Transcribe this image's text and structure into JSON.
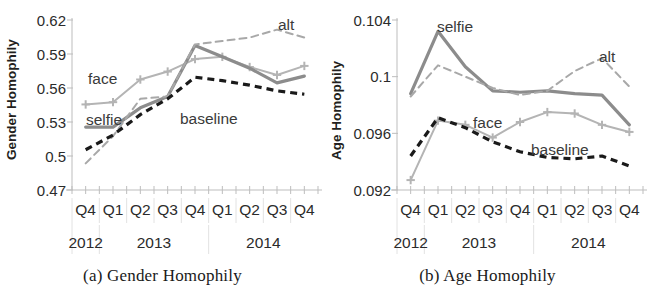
{
  "figure": {
    "panels": [
      {
        "id": "gender",
        "caption": "(a) Gender Homophily"
      },
      {
        "id": "age",
        "caption": "(b) Age Homophily"
      }
    ]
  },
  "chart_data": [
    {
      "type": "line",
      "title": "(a) Gender Homophily",
      "xlabel": "",
      "ylabel": "Gender Homophily",
      "categories": [
        "Q4",
        "Q1",
        "Q2",
        "Q3",
        "Q4",
        "Q1",
        "Q2",
        "Q3",
        "Q4"
      ],
      "year_groups": [
        {
          "label": "2012",
          "span": [
            0,
            0
          ]
        },
        {
          "label": "2013",
          "span": [
            1,
            4
          ]
        },
        {
          "label": "2014",
          "span": [
            5,
            8
          ]
        }
      ],
      "yticks": [
        0.47,
        0.5,
        0.53,
        0.56,
        0.59,
        0.62
      ],
      "ytick_labels": [
        "0.47",
        "0.5",
        "0.53",
        "0.56",
        "0.59",
        "0.62"
      ],
      "ylim": [
        0.47,
        0.62
      ],
      "grid": true,
      "legend": "inline-annotations",
      "series": [
        {
          "name": "face",
          "style": "solid-marker",
          "color": "#b4b4b4",
          "marker": "plus",
          "values": [
            0.5455,
            0.5475,
            0.5675,
            0.5745,
            0.5855,
            0.5875,
            0.5785,
            0.5715,
            0.5795
          ]
        },
        {
          "name": "selfie",
          "style": "solid-thick",
          "color": "#8c8c8c",
          "marker": "none",
          "values": [
            0.5255,
            0.5255,
            0.5425,
            0.5525,
            0.5975,
            0.5875,
            0.5775,
            0.5645,
            0.5705
          ]
        },
        {
          "name": "alt",
          "style": "dashed",
          "color": "#a8a8a8",
          "marker": "none",
          "values": [
            0.4935,
            0.5175,
            0.5505,
            0.5525,
            0.5985,
            0.6015,
            0.6045,
            0.6115,
            0.6045
          ]
        },
        {
          "name": "baseline",
          "style": "dashed-bold",
          "color": "#1a1a1a",
          "marker": "none",
          "values": [
            0.5055,
            0.5185,
            0.5365,
            0.5505,
            0.5695,
            0.5665,
            0.5625,
            0.5575,
            0.5545
          ]
        }
      ],
      "annotations": [
        {
          "text": "face",
          "series": "face"
        },
        {
          "text": "selfie",
          "series": "selfie"
        },
        {
          "text": "alt",
          "series": "alt"
        },
        {
          "text": "baseline",
          "series": "baseline"
        }
      ]
    },
    {
      "type": "line",
      "title": "(b) Age Homophily",
      "xlabel": "",
      "ylabel": "Age Homophily",
      "categories": [
        "Q4",
        "Q1",
        "Q2",
        "Q3",
        "Q4",
        "Q1",
        "Q2",
        "Q3",
        "Q4"
      ],
      "year_groups": [
        {
          "label": "2012",
          "span": [
            0,
            0
          ]
        },
        {
          "label": "2013",
          "span": [
            1,
            4
          ]
        },
        {
          "label": "2014",
          "span": [
            5,
            8
          ]
        }
      ],
      "yticks": [
        0.092,
        0.096,
        0.1,
        0.104
      ],
      "ytick_labels": [
        "0.092",
        "0.096",
        "0.1",
        "0.104"
      ],
      "ylim": [
        0.092,
        0.104
      ],
      "grid": true,
      "legend": "inline-annotations",
      "series": [
        {
          "name": "selfie",
          "style": "solid-thick",
          "color": "#8c8c8c",
          "marker": "none",
          "values": [
            0.0988,
            0.1032,
            0.1007,
            0.099,
            0.0989,
            0.099,
            0.0988,
            0.0987,
            0.0966
          ]
        },
        {
          "name": "alt",
          "style": "dashed",
          "color": "#a8a8a8",
          "marker": "none",
          "values": [
            0.0986,
            0.1008,
            0.1,
            0.0992,
            0.0987,
            0.099,
            0.1004,
            0.1013,
            0.0993
          ]
        },
        {
          "name": "face",
          "style": "solid-marker",
          "color": "#b4b4b4",
          "marker": "plus",
          "values": [
            0.0927,
            0.0969,
            0.0966,
            0.0957,
            0.0968,
            0.0975,
            0.0974,
            0.0966,
            0.0961
          ]
        },
        {
          "name": "baseline",
          "style": "dashed-bold",
          "color": "#1a1a1a",
          "marker": "none",
          "values": [
            0.0944,
            0.0971,
            0.0964,
            0.0954,
            0.0947,
            0.0943,
            0.0942,
            0.0944,
            0.0937
          ]
        }
      ],
      "annotations": [
        {
          "text": "selfie",
          "series": "selfie"
        },
        {
          "text": "alt",
          "series": "alt"
        },
        {
          "text": "face",
          "series": "face"
        },
        {
          "text": "baseline",
          "series": "baseline"
        }
      ]
    }
  ]
}
